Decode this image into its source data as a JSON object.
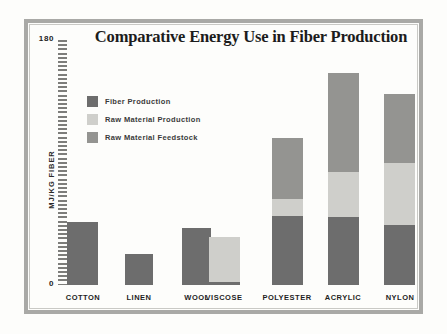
{
  "chart_data": {
    "type": "bar",
    "subtype": "stacked-bar",
    "title": "Comparative Energy Use in Fiber Production",
    "xlabel": "",
    "ylabel": "MJ/KG FIBER",
    "ylim": [
      0,
      180
    ],
    "ytick_labels": [
      "0",
      "180"
    ],
    "grid": false,
    "legend_position": "inside-top-left",
    "categories": [
      "COTTON",
      "LINEN",
      "WOOL",
      "VISCOSE",
      "POLYESTER",
      "ACRYLIC",
      "NYLON"
    ],
    "series": [
      {
        "name": "Fiber Production",
        "color": "#6d6d6d",
        "values": [
          46,
          23,
          42,
          2,
          51,
          50,
          44
        ]
      },
      {
        "name": "Raw Material Production",
        "color": "#cfcfcb",
        "values": [
          0,
          0,
          0,
          33,
          12,
          33,
          46
        ]
      },
      {
        "name": "Raw Material Feedstock",
        "color": "#949491",
        "values": [
          0,
          0,
          0,
          0,
          45,
          73,
          50
        ]
      }
    ],
    "totals": [
      46,
      23,
      42,
      35,
      108,
      156,
      140
    ]
  },
  "title": "Comparative Energy Use in Fiber Production",
  "axis": {
    "y_title": "MJ/KG FIBER",
    "y_max_label": "180",
    "y_min_label": "0"
  },
  "legend": {
    "items": [
      {
        "label": "Fiber Production",
        "color": "#6d6d6d"
      },
      {
        "label": "Raw Material Production",
        "color": "#cfcfcb"
      },
      {
        "label": "Raw Material Feedstock",
        "color": "#949491"
      }
    ]
  },
  "categories": [
    "COTTON",
    "LINEN",
    "WOOL",
    "VISCOSE",
    "POLYESTER",
    "ACRYLIC",
    "NYLON"
  ]
}
